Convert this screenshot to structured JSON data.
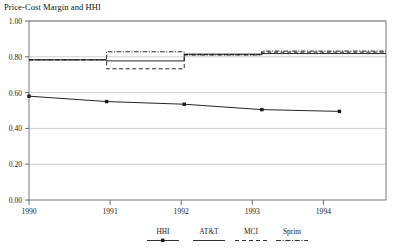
{
  "chart_data": {
    "type": "line",
    "title": "Price-Cost Margin and HHI",
    "xlabel": "",
    "ylabel": "",
    "xlim": [
      1990,
      1994.6
    ],
    "ylim": [
      0.0,
      1.0
    ],
    "grid": true,
    "legend_position": "bottom-center",
    "x_ticks": [
      "1990",
      "1991",
      "1992",
      "1993",
      "1994"
    ],
    "x_tick_values": [
      1990,
      1991,
      1992,
      1993,
      1994
    ],
    "y_ticks": [
      "0.00",
      "0.20",
      "0.40",
      "0.60",
      "0.80",
      "1.00"
    ],
    "y_tick_values": [
      0.0,
      0.2,
      0.4,
      0.6,
      0.8,
      1.0
    ],
    "series": [
      {
        "name": "HHI",
        "style": "solid-marker",
        "marker": "square",
        "x": [
          1990,
          1991,
          1992,
          1993,
          1994
        ],
        "values": [
          0.58,
          0.55,
          0.535,
          0.505,
          0.495
        ]
      },
      {
        "name": "AT&T",
        "style": "solid",
        "marker": "none",
        "x": [
          1990,
          1991,
          1991,
          1992,
          1992,
          1993,
          1993,
          1994,
          1994.6
        ],
        "values": [
          0.783,
          0.783,
          0.777,
          0.777,
          0.815,
          0.815,
          0.818,
          0.818,
          0.818
        ]
      },
      {
        "name": "MCI",
        "style": "dashed",
        "marker": "none",
        "x": [
          1990,
          1991,
          1991,
          1992,
          1992,
          1993,
          1993,
          1994,
          1994.6
        ],
        "values": [
          0.783,
          0.783,
          0.733,
          0.733,
          0.812,
          0.812,
          0.826,
          0.826,
          0.826
        ]
      },
      {
        "name": "Sprint",
        "style": "dash-dot",
        "marker": "none",
        "x": [
          1990,
          1991,
          1991,
          1992,
          1992,
          1993,
          1993,
          1994,
          1994.6
        ],
        "values": [
          0.783,
          0.783,
          0.828,
          0.828,
          0.81,
          0.81,
          0.832,
          0.832,
          0.832
        ]
      }
    ]
  },
  "legend": {
    "entries": [
      {
        "label": "HHI"
      },
      {
        "label": "AT&T"
      },
      {
        "label": "MCI"
      },
      {
        "label": "Sprint"
      }
    ]
  },
  "colors": {
    "line": "#1a1a1a",
    "grid": "#b8b8b8",
    "axis": "#555555",
    "background": "#ffffff"
  }
}
